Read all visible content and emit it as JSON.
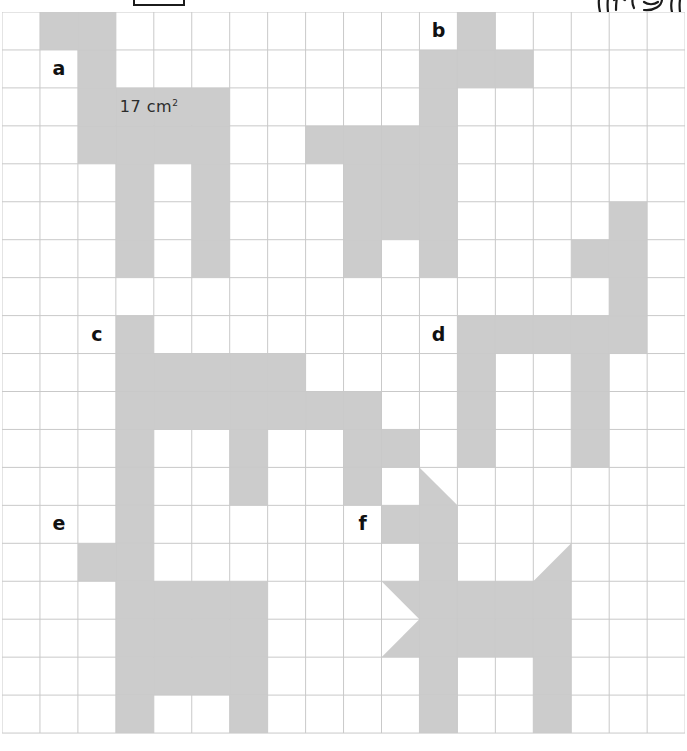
{
  "worksheet": {
    "answer_box": {
      "name": "answer-box",
      "value": ""
    },
    "doodle": {
      "name": "margin-doodle",
      "description": "partial handwritten doodle clipped at top right"
    },
    "area_annotation": {
      "number": "17",
      "unit": "cm",
      "exponent": "2",
      "full_text": "17 cm²",
      "col": 3,
      "row": 2
    }
  },
  "grid": {
    "columns": 18,
    "rows": 19,
    "cell_size": 37.95,
    "origin_x": 2,
    "origin_y": 12,
    "line_color": "#c9c9c9",
    "shade_color": "#cccccc",
    "background": "#ffffff"
  },
  "labels": [
    {
      "text": "a",
      "col": 1,
      "row": 1
    },
    {
      "text": "b",
      "col": 11,
      "row": 0
    },
    {
      "text": "c",
      "col": 2,
      "row": 8
    },
    {
      "text": "d",
      "col": 11,
      "row": 8
    },
    {
      "text": "e",
      "col": 1,
      "row": 13
    },
    {
      "text": "f",
      "col": 9,
      "row": 13
    }
  ],
  "shapes": {
    "a": {
      "label": "a",
      "cells": [
        [
          1,
          0
        ],
        [
          2,
          0
        ],
        [
          2,
          1
        ],
        [
          2,
          2
        ],
        [
          3,
          2
        ],
        [
          4,
          2
        ],
        [
          5,
          2
        ],
        [
          2,
          3
        ],
        [
          3,
          3
        ],
        [
          4,
          3
        ],
        [
          5,
          3
        ],
        [
          3,
          4
        ],
        [
          5,
          4
        ],
        [
          3,
          5
        ],
        [
          5,
          5
        ],
        [
          3,
          6
        ],
        [
          5,
          6
        ]
      ],
      "area_cm2": 17
    },
    "b": {
      "label": "b",
      "cells": [
        [
          12,
          0
        ],
        [
          11,
          1
        ],
        [
          12,
          1
        ],
        [
          13,
          1
        ],
        [
          11,
          2
        ],
        [
          8,
          3
        ],
        [
          9,
          3
        ],
        [
          10,
          3
        ],
        [
          11,
          3
        ],
        [
          9,
          4
        ],
        [
          10,
          4
        ],
        [
          11,
          4
        ],
        [
          9,
          5
        ],
        [
          10,
          5
        ],
        [
          11,
          5
        ],
        [
          16,
          5
        ],
        [
          9,
          6
        ],
        [
          11,
          6
        ],
        [
          15,
          6
        ],
        [
          16,
          6
        ],
        [
          16,
          7
        ]
      ]
    },
    "c": {
      "label": "c",
      "cells": [
        [
          3,
          8
        ],
        [
          3,
          9
        ],
        [
          4,
          9
        ],
        [
          5,
          9
        ],
        [
          6,
          9
        ],
        [
          7,
          9
        ],
        [
          3,
          10
        ],
        [
          4,
          10
        ],
        [
          5,
          10
        ],
        [
          6,
          10
        ],
        [
          7,
          10
        ],
        [
          8,
          10
        ],
        [
          9,
          10
        ],
        [
          3,
          11
        ],
        [
          6,
          11
        ],
        [
          9,
          11
        ],
        [
          10,
          11
        ],
        [
          3,
          12
        ],
        [
          6,
          12
        ],
        [
          9,
          12
        ]
      ]
    },
    "d": {
      "label": "d",
      "cells": [
        [
          12,
          8
        ],
        [
          13,
          8
        ],
        [
          14,
          8
        ],
        [
          15,
          8
        ],
        [
          16,
          8
        ],
        [
          12,
          9
        ],
        [
          15,
          9
        ],
        [
          12,
          10
        ],
        [
          15,
          10
        ],
        [
          12,
          11
        ],
        [
          15,
          11
        ]
      ]
    },
    "e": {
      "label": "e",
      "cells": [
        [
          3,
          13
        ],
        [
          2,
          14
        ],
        [
          3,
          14
        ],
        [
          3,
          15
        ],
        [
          4,
          15
        ],
        [
          5,
          15
        ],
        [
          6,
          15
        ],
        [
          3,
          16
        ],
        [
          4,
          16
        ],
        [
          5,
          16
        ],
        [
          6,
          16
        ],
        [
          3,
          17
        ],
        [
          4,
          17
        ],
        [
          5,
          17
        ],
        [
          6,
          17
        ],
        [
          3,
          18
        ],
        [
          6,
          18
        ]
      ]
    },
    "f": {
      "label": "f",
      "cells": [
        [
          10,
          13
        ],
        [
          11,
          13
        ],
        [
          11,
          14
        ],
        [
          11,
          15
        ],
        [
          12,
          15
        ],
        [
          13,
          15
        ],
        [
          14,
          15
        ],
        [
          11,
          16
        ],
        [
          12,
          16
        ],
        [
          13,
          16
        ],
        [
          14,
          16
        ],
        [
          11,
          17
        ],
        [
          14,
          17
        ],
        [
          11,
          18
        ],
        [
          14,
          18
        ]
      ],
      "triangles": [
        {
          "col": 11,
          "row": 12,
          "kind": "lower-left-half",
          "note": "ear"
        },
        {
          "col": 14,
          "row": 14,
          "kind": "lower-right-half",
          "note": "tail"
        },
        {
          "col": 10,
          "row": 15,
          "kind": "upper-right-half",
          "note": "head-top"
        },
        {
          "col": 10,
          "row": 16,
          "kind": "lower-right-half",
          "note": "head-bottom"
        }
      ]
    }
  }
}
